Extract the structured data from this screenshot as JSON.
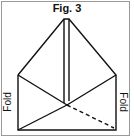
{
  "figure": {
    "title": "Fig. 3",
    "labels": {
      "left": "Fold",
      "right": "Fold"
    },
    "colors": {
      "line": "#111111",
      "frame": "#9a9a9a",
      "background": "#ffffff"
    }
  }
}
